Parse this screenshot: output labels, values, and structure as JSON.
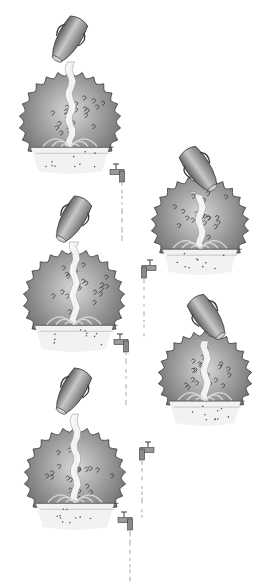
{
  "image": {
    "description": "Five pencil-shaded illustrations of spiky spherical bodies, each filled by water poured from a tilted jug at top and drained through a faucet at the base",
    "background": "#ffffff",
    "stroke_color": "#3a3a3a",
    "shade_dark": "#6e6e6e",
    "shade_light": "#d8d8d8",
    "water_color": "#f4f6f7"
  },
  "scenes": [
    {
      "id": "scene-1",
      "cx": 70,
      "cy": 122,
      "r": 46,
      "jug": {
        "x": 68,
        "y": 40,
        "angle": 30
      },
      "faucet_side": "right",
      "faucet": {
        "x": 114,
        "y": 172
      },
      "drip_len": 62
    },
    {
      "id": "scene-2",
      "cx": 200,
      "cy": 225,
      "r": 44,
      "jug": {
        "x": 200,
        "y": 170,
        "angle": -35
      },
      "faucet_side": "left",
      "faucet": {
        "x": 152,
        "y": 268
      },
      "drip_len": 60
    },
    {
      "id": "scene-3",
      "cx": 74,
      "cy": 300,
      "r": 46,
      "jug": {
        "x": 72,
        "y": 220,
        "angle": 30
      },
      "faucet_side": "right",
      "faucet": {
        "x": 118,
        "y": 342
      },
      "drip_len": 50
    },
    {
      "id": "scene-4",
      "cx": 205,
      "cy": 378,
      "r": 42,
      "jug": {
        "x": 208,
        "y": 318,
        "angle": -35
      },
      "faucet_side": "left",
      "faucet": {
        "x": 150,
        "y": 450
      },
      "drip_len": 60
    },
    {
      "id": "scene-5",
      "cx": 75,
      "cy": 478,
      "r": 46,
      "jug": {
        "x": 72,
        "y": 392,
        "angle": 30
      },
      "faucet_side": "right",
      "faucet": {
        "x": 122,
        "y": 520
      },
      "drip_len": 50
    }
  ]
}
